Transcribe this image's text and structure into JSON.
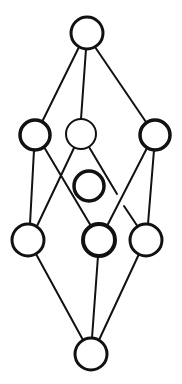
{
  "diagram": {
    "type": "lattice / Hasse diagram",
    "width": 182,
    "height": 384,
    "stroke_color": "#111111",
    "background": "#ffffff",
    "nodes": [
      {
        "id": "top",
        "cx": 87,
        "cy": 33,
        "r": 16,
        "stroke_width": 3
      },
      {
        "id": "mid-left",
        "cx": 35,
        "cy": 135,
        "r": 15,
        "stroke_width": 3.5
      },
      {
        "id": "mid-center",
        "cx": 81,
        "cy": 134,
        "r": 15,
        "stroke_width": 2
      },
      {
        "id": "mid-right",
        "cx": 155,
        "cy": 135,
        "r": 15,
        "stroke_width": 3.5
      },
      {
        "id": "isolated",
        "cx": 89,
        "cy": 186,
        "r": 15,
        "stroke_width": 3.5
      },
      {
        "id": "low-left",
        "cx": 28,
        "cy": 240,
        "r": 16,
        "stroke_width": 3
      },
      {
        "id": "low-center",
        "cx": 99,
        "cy": 240,
        "r": 16,
        "stroke_width": 4
      },
      {
        "id": "low-right",
        "cx": 146,
        "cy": 240,
        "r": 16,
        "stroke_width": 3
      },
      {
        "id": "bottom",
        "cx": 91,
        "cy": 354,
        "r": 16,
        "stroke_width": 3
      }
    ],
    "edges": [
      {
        "from": "top",
        "to": "mid-left",
        "x1": 79,
        "y1": 47,
        "x2": 42,
        "y2": 122
      },
      {
        "from": "top",
        "to": "mid-center",
        "x1": 86,
        "y1": 49,
        "x2": 81,
        "y2": 119
      },
      {
        "from": "top",
        "to": "mid-right",
        "x1": 95,
        "y1": 47,
        "x2": 146,
        "y2": 122
      },
      {
        "from": "mid-left",
        "to": "low-left",
        "x1": 34,
        "y1": 150,
        "x2": 30,
        "y2": 224
      },
      {
        "from": "mid-left",
        "to": "low-center",
        "x1": 44,
        "y1": 147,
        "x2": 91,
        "y2": 226
      },
      {
        "from": "mid-center",
        "to": "low-left",
        "x1": 74,
        "y1": 148,
        "x2": 37,
        "y2": 226
      },
      {
        "from": "mid-center",
        "to": "low-right",
        "x1": 89,
        "y1": 147,
        "x2": 117,
        "y2": 194
      },
      {
        "from": "mid-center",
        "to": "low-right",
        "x1": 124,
        "y1": 206,
        "x2": 138,
        "y2": 227
      },
      {
        "from": "mid-right",
        "to": "low-center",
        "x1": 147,
        "y1": 148,
        "x2": 107,
        "y2": 226
      },
      {
        "from": "mid-right",
        "to": "low-right",
        "x1": 154,
        "y1": 150,
        "x2": 148,
        "y2": 224
      },
      {
        "from": "low-left",
        "to": "bottom",
        "x1": 36,
        "y1": 254,
        "x2": 83,
        "y2": 340
      },
      {
        "from": "low-center",
        "to": "bottom",
        "x1": 98,
        "y1": 256,
        "x2": 92,
        "y2": 338
      },
      {
        "from": "low-right",
        "to": "bottom",
        "x1": 139,
        "y1": 254,
        "x2": 99,
        "y2": 340
      }
    ]
  }
}
